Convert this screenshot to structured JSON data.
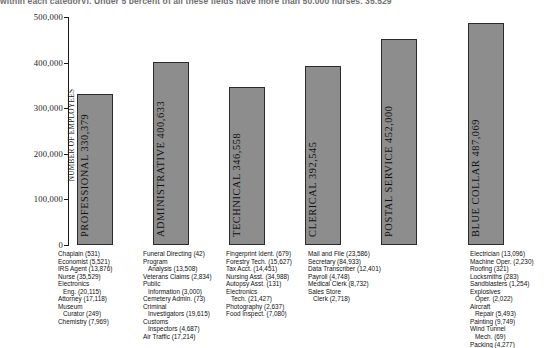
{
  "clipped_header": "within each category).      Under 5 percent of all these fields have more than 50,000 nurses, 35,529",
  "chart_data": {
    "type": "bar",
    "title": "",
    "xlabel": "",
    "ylabel": "NUMBER OF EMPLOYEES",
    "ylim": [
      0,
      500000
    ],
    "ytick_labels": [
      "500,000",
      "400,000",
      "300,000",
      "200,000",
      "100,000",
      "0"
    ],
    "ytick_values": [
      500000,
      400000,
      300000,
      200000,
      100000,
      0
    ],
    "grid": false,
    "legend": null,
    "categories": [
      "PROFESSIONAL",
      "ADMINISTRATIVE",
      "TECHNICAL",
      "CLERICAL",
      "POSTAL SERVICE",
      "BLUE COLLAR"
    ],
    "values": [
      330379,
      400633,
      346558,
      392545,
      452000,
      487069
    ],
    "bar_labels": [
      "PROFESSIONAL 330,379",
      "ADMINISTRATIVE 400,633",
      "TECHNICAL 346,558",
      "CLERICAL 392,545",
      "POSTAL SERVICE 452,000",
      "BLUE COLLAR 487,069"
    ],
    "bar_color": "#8d8d8d",
    "bar_border_color": "#2b2b2b"
  },
  "occupations": [
    {
      "category": "PROFESSIONAL",
      "lines": [
        {
          "text": "Chaplain (531)",
          "indent": false
        },
        {
          "text": "Economist (5,521)",
          "indent": false
        },
        {
          "text": "IRS Agent (13,876)",
          "indent": false
        },
        {
          "text": "Nurse (35,529)",
          "indent": false
        },
        {
          "text": "Electronics",
          "indent": false
        },
        {
          "text": "Eng. (20,115)",
          "indent": true
        },
        {
          "text": "Attorney (17,118)",
          "indent": false
        },
        {
          "text": "Museum",
          "indent": false
        },
        {
          "text": "Curator (249)",
          "indent": true
        },
        {
          "text": "Chemistry (7,969)",
          "indent": false
        }
      ]
    },
    {
      "category": "ADMINISTRATIVE",
      "lines": [
        {
          "text": "Funeral Directing (42)",
          "indent": false
        },
        {
          "text": "Program",
          "indent": false
        },
        {
          "text": "Analysis (13,508)",
          "indent": true
        },
        {
          "text": "Veterans Claims (2,834)",
          "indent": false
        },
        {
          "text": "Public",
          "indent": false
        },
        {
          "text": "Information (3,000)",
          "indent": true
        },
        {
          "text": "Cemetery Admin. (73)",
          "indent": false
        },
        {
          "text": "Criminal",
          "indent": false
        },
        {
          "text": "Investigators (19,615)",
          "indent": true
        },
        {
          "text": "Customs",
          "indent": false
        },
        {
          "text": "Inspectors (4,687)",
          "indent": true
        },
        {
          "text": "Air Traffic (17,214)",
          "indent": false
        }
      ]
    },
    {
      "category": "TECHNICAL",
      "lines": [
        {
          "text": "Fingerprint Ident. (679)",
          "indent": false
        },
        {
          "text": "Forestry Tech. (15,627)",
          "indent": false
        },
        {
          "text": "Tax Acct. (14,451)",
          "indent": false
        },
        {
          "text": "Nursing Asst. (34,988)",
          "indent": false
        },
        {
          "text": "Autopsy Asst. (131)",
          "indent": false
        },
        {
          "text": "Electronics",
          "indent": false
        },
        {
          "text": "Tech. (21,427)",
          "indent": true
        },
        {
          "text": "Photography (2,637)",
          "indent": false
        },
        {
          "text": "Food Inspect. (7,080)",
          "indent": false
        }
      ]
    },
    {
      "category": "CLERICAL",
      "lines": [
        {
          "text": "Mail and File (23,586)",
          "indent": false
        },
        {
          "text": "Secretary (84,933)",
          "indent": false
        },
        {
          "text": "Data Transcriber (12,401)",
          "indent": false
        },
        {
          "text": "Payroll (4,748)",
          "indent": false
        },
        {
          "text": "Medical Clerk (8,732)",
          "indent": false
        },
        {
          "text": "Sales Store",
          "indent": false
        },
        {
          "text": "Clerk (2,718)",
          "indent": true
        }
      ]
    },
    {
      "category": "BLUE COLLAR",
      "lines": [
        {
          "text": "Electrician (13,096)",
          "indent": false
        },
        {
          "text": "Machine Oper. (2,230)",
          "indent": false
        },
        {
          "text": "Roofing (321)",
          "indent": false
        },
        {
          "text": "Locksmiths (283)",
          "indent": false
        },
        {
          "text": "Sandblasters (1,254)",
          "indent": false
        },
        {
          "text": "Explosives",
          "indent": false
        },
        {
          "text": "Oper. (2,022)",
          "indent": true
        },
        {
          "text": "Aircraft",
          "indent": false
        },
        {
          "text": "Repair (5,493)",
          "indent": true
        },
        {
          "text": "Painting (9,749)",
          "indent": false
        },
        {
          "text": "Wind Tunnel",
          "indent": false
        },
        {
          "text": "Mech. (69)",
          "indent": true
        },
        {
          "text": "Packing (4,277)",
          "indent": false
        }
      ]
    }
  ]
}
